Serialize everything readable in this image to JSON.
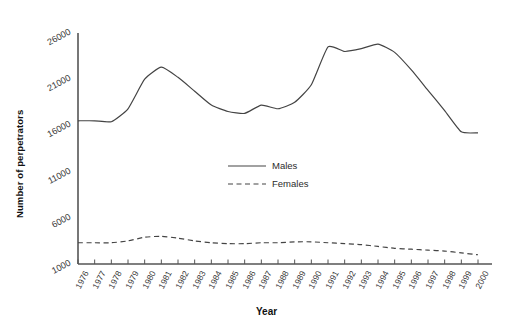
{
  "chart_data": {
    "type": "line",
    "title": "",
    "xlabel": "Year",
    "ylabel": "Number of perpetrators",
    "grid": false,
    "legend_position": "center",
    "xlim": [
      1976,
      2000
    ],
    "ylim": [
      1000,
      26000
    ],
    "ytick_labels": [
      "1000",
      "6000",
      "11000",
      "16000",
      "21000",
      "26000"
    ],
    "ytick_values": [
      1000,
      6000,
      11000,
      16000,
      21000,
      26000
    ],
    "categories": [
      "1976",
      "1977",
      "1978",
      "1979",
      "1980",
      "1981",
      "1982",
      "1983",
      "1984",
      "1985",
      "1986",
      "1987",
      "1988",
      "1989",
      "1990",
      "1991",
      "1992",
      "1993",
      "1994",
      "1995",
      "1996",
      "1997",
      "1998",
      "1999",
      "2000"
    ],
    "series": [
      {
        "name": "Males",
        "style": "solid",
        "color": "#444444",
        "values": [
          16500,
          16500,
          16400,
          17800,
          21000,
          22300,
          21200,
          19700,
          18200,
          17500,
          17300,
          18200,
          17800,
          18500,
          20400,
          24500,
          24000,
          24300,
          24800,
          23900,
          22000,
          19800,
          17600,
          15300,
          15200
        ]
      },
      {
        "name": "Females",
        "style": "dashed",
        "color": "#444444",
        "values": [
          3300,
          3300,
          3300,
          3500,
          3900,
          4000,
          3800,
          3500,
          3300,
          3200,
          3200,
          3300,
          3300,
          3400,
          3400,
          3300,
          3200,
          3100,
          2900,
          2700,
          2600,
          2500,
          2400,
          2200,
          2000
        ]
      }
    ],
    "legend": [
      {
        "label": "Males",
        "style": "solid"
      },
      {
        "label": "Females",
        "style": "dashed"
      }
    ]
  }
}
